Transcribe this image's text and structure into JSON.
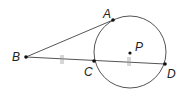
{
  "diagram": {
    "colors": {
      "stroke": "#555555",
      "point": "#111111",
      "label": "#222222"
    },
    "circle": {
      "center_label": "P",
      "cx": 130,
      "cy": 52,
      "r": 36
    },
    "points": {
      "A": {
        "label": "A",
        "x": 113,
        "y": 20
      },
      "B": {
        "label": "B",
        "x": 26,
        "y": 57
      },
      "C": {
        "label": "C",
        "x": 94,
        "y": 61
      },
      "D": {
        "label": "D",
        "x": 165,
        "y": 64
      },
      "P": {
        "label": "P",
        "x": 130,
        "y": 53
      }
    },
    "segments": [
      "BA",
      "BD"
    ],
    "congruence_marks": [
      {
        "segment": "BC",
        "ticks": 2
      },
      {
        "segment": "CD",
        "ticks": 2
      }
    ]
  }
}
